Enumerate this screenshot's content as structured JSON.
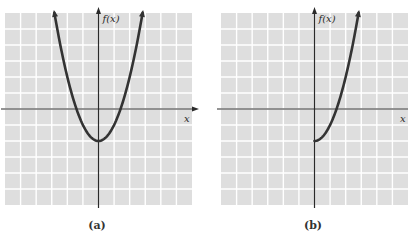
{
  "figure": {
    "panels": [
      {
        "id": "a",
        "caption": "(a)",
        "ylabel": "f(x)",
        "xlabel": "x"
      },
      {
        "id": "b",
        "caption": "(b)",
        "ylabel": "f(x)",
        "xlabel": "x"
      }
    ]
  },
  "colors": {
    "cell": "#dedede",
    "gridline": "#ffffff",
    "axis": "#2a2a2a",
    "curve": "#333333",
    "caption": "#333333"
  },
  "chart_data": [
    {
      "type": "line",
      "title": "(a)",
      "xlabel": "x",
      "ylabel": "f(x)",
      "xlim": [
        -6,
        6
      ],
      "ylim": [
        -6,
        6
      ],
      "grid": true,
      "tick_labels": false,
      "series": [
        {
          "name": "f(x) = x^2 - 2 (full parabola, arrows at both ends)",
          "x": [
            -2.83,
            -2.5,
            -2,
            -1.5,
            -1.41,
            -1,
            -0.5,
            0,
            0.5,
            1,
            1.41,
            1.5,
            2,
            2.5,
            2.83
          ],
          "y": [
            6,
            4.25,
            2,
            0.25,
            0,
            -1,
            -1.75,
            -2,
            -1.75,
            -1,
            0,
            0.25,
            2,
            4.25,
            6
          ]
        }
      ],
      "annotations": [
        "vertex at (0, -2)",
        "x-intercepts near ±1.41"
      ]
    },
    {
      "type": "line",
      "title": "(b)",
      "xlabel": "x",
      "ylabel": "f(x)",
      "xlim": [
        -6,
        6
      ],
      "ylim": [
        -6,
        6
      ],
      "grid": true,
      "tick_labels": false,
      "series": [
        {
          "name": "f(x) = x^2 - 2, x >= 0 (right half, arrow at top)",
          "x": [
            0,
            0.5,
            1,
            1.41,
            1.5,
            2,
            2.5,
            2.83
          ],
          "y": [
            -2,
            -1.75,
            -1,
            0,
            0.25,
            2,
            4.25,
            6
          ]
        }
      ],
      "annotations": [
        "starts at (0, -2)",
        "x-intercept near 1.41"
      ]
    }
  ]
}
